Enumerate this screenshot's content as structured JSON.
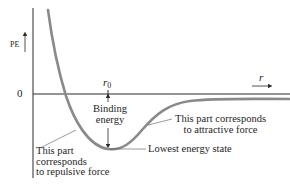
{
  "diagram": {
    "y_axis_label": "PE",
    "zero_label": "0",
    "r0_label": "r",
    "r0_subscript": "0",
    "x_axis_label": "r",
    "annotations": {
      "binding_energy": "Binding energy",
      "attractive": [
        "This part corresponds",
        "to attractive force"
      ],
      "repulsive": [
        "This part",
        "corresponds",
        "to repulsive force"
      ],
      "lowest_state": "Lowest energy state"
    },
    "colors": {
      "curve": "#8a8a8a",
      "axes": "#2a2a2a",
      "text": "#1e1e1e",
      "background": "#ffffff"
    }
  }
}
